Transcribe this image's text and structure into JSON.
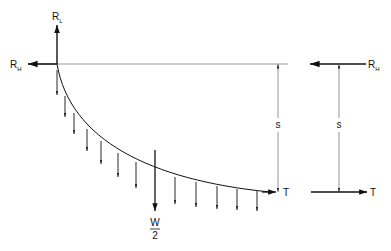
{
  "diagram": {
    "labels": {
      "rl": "R",
      "rl_sub": "L",
      "rh_left": "R",
      "rh_left_sub": "H",
      "rh_right": "R",
      "rh_right_sub": "H",
      "s_left": "s",
      "s_right": "s",
      "t_left": "T",
      "t_right": "T",
      "w_num": "W",
      "w_den": "2"
    },
    "colors": {
      "line": "#111111",
      "reference_line": "#999999"
    },
    "distributed_load_count": 13
  }
}
